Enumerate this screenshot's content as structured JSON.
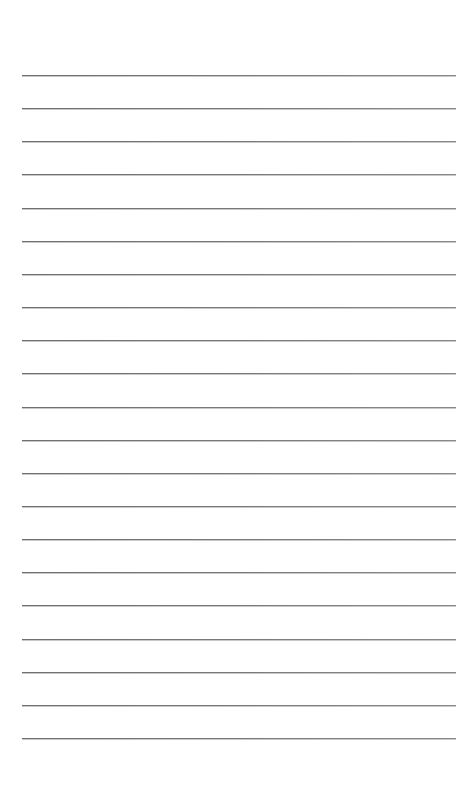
{
  "document": {
    "type": "lined-paper",
    "background_color": "#ffffff",
    "line_color": "#777777",
    "line_count": 21,
    "line_left": 22,
    "line_right": 456,
    "first_line_y": 75,
    "line_spacing": 33.15,
    "text": []
  }
}
